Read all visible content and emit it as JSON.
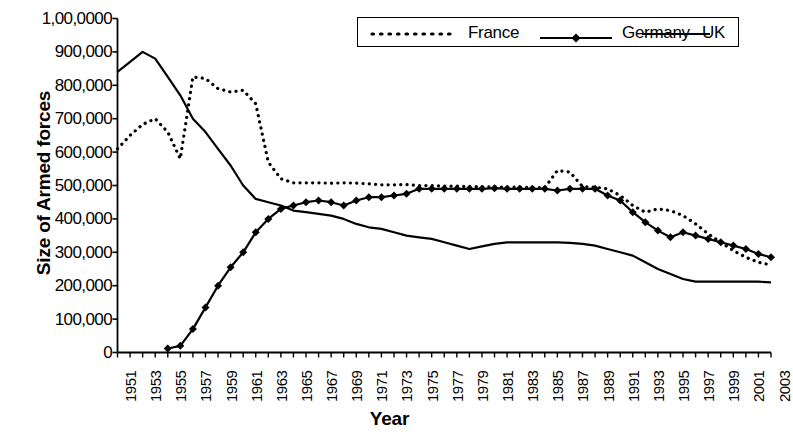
{
  "chart_data": {
    "type": "line",
    "title": "",
    "xlabel": "Year",
    "ylabel": "Size of Armed forces",
    "xlim": [
      1951,
      2003
    ],
    "ylim": [
      0,
      1000000
    ],
    "grid": false,
    "legend_position": "top-right",
    "y_ticks": [
      0,
      100000,
      200000,
      300000,
      400000,
      500000,
      600000,
      700000,
      800000,
      900000,
      1000000
    ],
    "y_tick_labels": [
      "0",
      "100,000",
      "200,000",
      "300,000",
      "400,000",
      "500,000",
      "600,000",
      "700,000",
      "800,000",
      "900,000",
      "1,00,0000"
    ],
    "x_ticks": [
      1951,
      1953,
      1955,
      1957,
      1959,
      1961,
      1963,
      1965,
      1967,
      1969,
      1971,
      1973,
      1975,
      1977,
      1979,
      1981,
      1983,
      1985,
      1987,
      1989,
      1991,
      1993,
      1995,
      1997,
      1999,
      2001,
      2003
    ],
    "x_tick_labels": [
      "1951",
      "1953",
      "1955",
      "1957",
      "1959",
      "1961",
      "1963",
      "1965",
      "1967",
      "1969",
      "1971",
      "1973",
      "1975",
      "1977",
      "1979",
      "1981",
      "1983",
      "1985",
      "1987",
      "1989",
      "1991",
      "1993",
      "1995",
      "1997",
      "1999",
      "2001",
      "2003"
    ],
    "x": [
      1951,
      1952,
      1953,
      1954,
      1955,
      1956,
      1957,
      1958,
      1959,
      1960,
      1961,
      1962,
      1963,
      1964,
      1965,
      1966,
      1967,
      1968,
      1969,
      1970,
      1971,
      1972,
      1973,
      1974,
      1975,
      1976,
      1977,
      1978,
      1979,
      1980,
      1981,
      1982,
      1983,
      1984,
      1985,
      1986,
      1987,
      1988,
      1989,
      1990,
      1991,
      1992,
      1993,
      1994,
      1995,
      1996,
      1997,
      1998,
      1999,
      2000,
      2001,
      2002,
      2003
    ],
    "series": [
      {
        "name": "France",
        "style": "dotted",
        "marker": "none",
        "color": "#000000",
        "values": [
          610000,
          650000,
          683000,
          700000,
          660000,
          580000,
          825000,
          820000,
          790000,
          780000,
          785000,
          745000,
          570000,
          520000,
          508000,
          508000,
          508000,
          507000,
          508000,
          507000,
          505000,
          502000,
          502000,
          503000,
          500000,
          500000,
          498000,
          498000,
          497000,
          496000,
          496000,
          495000,
          495000,
          494000,
          493000,
          545000,
          540000,
          497000,
          495000,
          490000,
          470000,
          440000,
          420000,
          430000,
          425000,
          410000,
          385000,
          355000,
          330000,
          305000,
          285000,
          270000,
          262000
        ]
      },
      {
        "name": "Germany",
        "style": "solid",
        "marker": "diamond",
        "color": "#000000",
        "values": [
          null,
          null,
          null,
          null,
          12000,
          20000,
          70000,
          135000,
          200000,
          255000,
          300000,
          360000,
          400000,
          430000,
          440000,
          450000,
          455000,
          450000,
          440000,
          455000,
          465000,
          465000,
          470000,
          475000,
          490000,
          490000,
          490000,
          490000,
          490000,
          490000,
          492000,
          490000,
          490000,
          490000,
          490000,
          485000,
          490000,
          490000,
          490000,
          470000,
          455000,
          420000,
          390000,
          365000,
          345000,
          360000,
          350000,
          340000,
          330000,
          320000,
          310000,
          295000,
          285000
        ]
      },
      {
        "name": "UK",
        "style": "solid",
        "marker": "none",
        "color": "#000000",
        "values": [
          840000,
          870000,
          900000,
          880000,
          825000,
          770000,
          700000,
          660000,
          610000,
          560000,
          500000,
          460000,
          450000,
          440000,
          425000,
          420000,
          415000,
          410000,
          400000,
          385000,
          375000,
          370000,
          360000,
          350000,
          345000,
          340000,
          330000,
          320000,
          310000,
          318000,
          325000,
          330000,
          330000,
          330000,
          330000,
          330000,
          328000,
          325000,
          320000,
          310000,
          300000,
          290000,
          270000,
          250000,
          235000,
          220000,
          212000,
          212000,
          212000,
          212000,
          212000,
          212000,
          210000
        ]
      }
    ]
  },
  "legend": {
    "items": [
      {
        "label": "France",
        "style": "dotted",
        "marker": "none"
      },
      {
        "label": "Germany",
        "style": "solid",
        "marker": "diamond"
      },
      {
        "label": "UK",
        "style": "solid",
        "marker": "none"
      }
    ]
  }
}
